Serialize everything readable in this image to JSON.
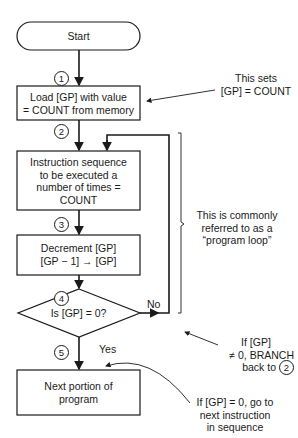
{
  "flowchart": {
    "start": {
      "label": "Start"
    },
    "steps": [
      {
        "number": "1",
        "label": "Load [GP] with value = COUNT from memory"
      },
      {
        "number": "2",
        "label": "Instruction sequence to be executed a number of times = COUNT"
      },
      {
        "number": "3",
        "label": "Decrement [GP] [GP − 1] → [GP]"
      },
      {
        "number": "4",
        "label": "Is [GP] = 0?"
      },
      {
        "number": "5",
        "label": "Next portion of program"
      }
    ],
    "lines": {
      "step1": [
        "Load [GP] with value",
        "= COUNT from memory"
      ],
      "step2": [
        "Instruction sequence",
        "to be executed a",
        "number of times =",
        "COUNT"
      ],
      "step3": [
        "Decrement [GP]",
        "[GP − 1] → [GP]"
      ],
      "decision": "Is [GP] = 0?",
      "step5": [
        "Next portion of",
        "program"
      ]
    },
    "branches": {
      "no": "No",
      "yes": "Yes"
    }
  },
  "annotations": {
    "sets_gp": [
      "This sets",
      "[GP] = COUNT"
    ],
    "program_loop": [
      "This is commonly",
      "referred to as a",
      "“program loop”"
    ],
    "branch_back": [
      "If [GP]",
      "≠ 0, BRANCH",
      "back to"
    ],
    "branch_back_target": "2",
    "next_instruction": [
      "If [GP] = 0, go to",
      "next instruction",
      "in sequence"
    ]
  }
}
